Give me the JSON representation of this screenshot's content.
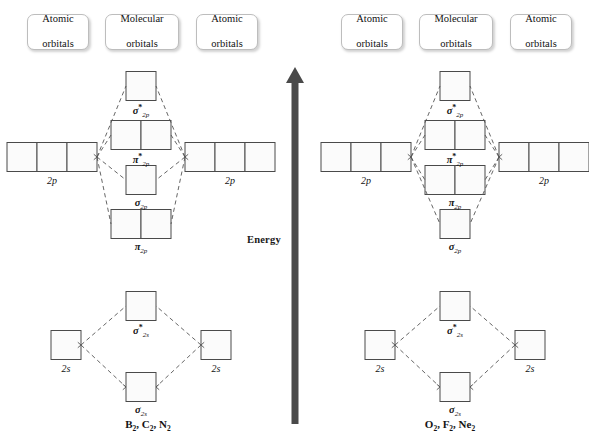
{
  "figure": {
    "energy_axis_label": "Energy",
    "energy_axis_direction": "up",
    "arrow_color": "#4a4a4a"
  },
  "headers": {
    "atomic_line1": "Atomic",
    "atomic_line2": "orbitals",
    "molecular_line1": "Molecular",
    "molecular_line2": "orbitals"
  },
  "diagrams": [
    {
      "id": "left",
      "caption": "B₂, C₂, N₂",
      "caption_parts": [
        {
          "el": "B",
          "sub": "2"
        },
        {
          "el": "C",
          "sub": "2"
        },
        {
          "el": "N",
          "sub": "2"
        }
      ],
      "atomic_p_label": "2p",
      "atomic_s_label": "2s",
      "atomic_p_boxes": 3,
      "atomic_s_boxes": 1,
      "p_block_order": [
        {
          "name": "sigma-star-2p",
          "sym": "σ",
          "star": true,
          "sub": "2p",
          "boxes": 1
        },
        {
          "name": "pi-star-2p",
          "sym": "π",
          "star": true,
          "sub": "2p",
          "boxes": 2
        },
        {
          "name": "sigma-2p",
          "sym": "σ",
          "star": false,
          "sub": "2p",
          "boxes": 1
        },
        {
          "name": "pi-2p",
          "sym": "π",
          "star": false,
          "sub": "2p",
          "boxes": 2
        }
      ],
      "s_block_order": [
        {
          "name": "sigma-star-2s",
          "sym": "σ",
          "star": true,
          "sub": "2s",
          "boxes": 1
        },
        {
          "name": "sigma-2s",
          "sym": "σ",
          "star": false,
          "sub": "2s",
          "boxes": 1
        }
      ]
    },
    {
      "id": "right",
      "caption": "O₂, F₂, Ne₂",
      "caption_parts": [
        {
          "el": "O",
          "sub": "2"
        },
        {
          "el": "F",
          "sub": "2"
        },
        {
          "el": "Ne",
          "sub": "2"
        }
      ],
      "atomic_p_label": "2p",
      "atomic_s_label": "2s",
      "atomic_p_boxes": 3,
      "atomic_s_boxes": 1,
      "p_block_order": [
        {
          "name": "sigma-star-2p",
          "sym": "σ",
          "star": true,
          "sub": "2p",
          "boxes": 1
        },
        {
          "name": "pi-star-2p",
          "sym": "π",
          "star": true,
          "sub": "2p",
          "boxes": 2
        },
        {
          "name": "pi-2p",
          "sym": "π",
          "star": false,
          "sub": "2p",
          "boxes": 2
        },
        {
          "name": "sigma-2p",
          "sym": "σ",
          "star": false,
          "sub": "2p",
          "boxes": 1
        }
      ],
      "s_block_order": [
        {
          "name": "sigma-star-2s",
          "sym": "σ",
          "star": true,
          "sub": "2s",
          "boxes": 1
        },
        {
          "name": "sigma-2s",
          "sym": "σ",
          "star": false,
          "sub": "2s",
          "boxes": 1
        }
      ]
    }
  ]
}
